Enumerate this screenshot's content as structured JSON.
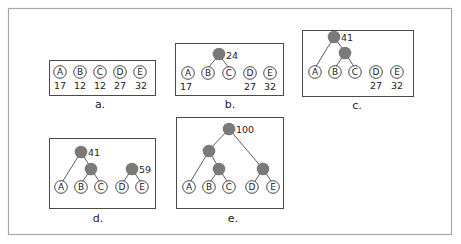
{
  "colors": {
    "leaf_fill": "#ffffff",
    "internal_node_fill": "#7a7a7a",
    "frame_border": "#a8a8a8",
    "panel_border": "#4a4a4a"
  },
  "symbols": [
    "A",
    "B",
    "C",
    "D",
    "E"
  ],
  "frequencies": {
    "A": 17,
    "B": 12,
    "C": 12,
    "D": 27,
    "E": 32
  },
  "panels": [
    {
      "id": "a",
      "caption": "a.",
      "leaves": [
        {
          "label": "A",
          "weight": "17"
        },
        {
          "label": "B",
          "weight": "12"
        },
        {
          "label": "C",
          "weight": "12"
        },
        {
          "label": "D",
          "weight": "27"
        },
        {
          "label": "E",
          "weight": "32"
        }
      ],
      "internal_nodes": []
    },
    {
      "id": "b",
      "caption": "b.",
      "leaves": [
        {
          "label": "A",
          "weight": "17"
        },
        {
          "label": "B",
          "weight": ""
        },
        {
          "label": "C",
          "weight": ""
        },
        {
          "label": "D",
          "weight": "27"
        },
        {
          "label": "E",
          "weight": "32"
        }
      ],
      "internal_nodes": [
        {
          "children": [
            "B",
            "C"
          ],
          "weight": "24"
        }
      ]
    },
    {
      "id": "c",
      "caption": "c.",
      "leaves": [
        {
          "label": "A",
          "weight": ""
        },
        {
          "label": "B",
          "weight": ""
        },
        {
          "label": "C",
          "weight": ""
        },
        {
          "label": "D",
          "weight": "27"
        },
        {
          "label": "E",
          "weight": "32"
        }
      ],
      "internal_nodes": [
        {
          "children": [
            "B",
            "C"
          ],
          "weight": ""
        },
        {
          "children": [
            "A",
            "BC"
          ],
          "weight": "41"
        }
      ]
    },
    {
      "id": "d",
      "caption": "d.",
      "leaves": [
        {
          "label": "A",
          "weight": ""
        },
        {
          "label": "B",
          "weight": ""
        },
        {
          "label": "C",
          "weight": ""
        },
        {
          "label": "D",
          "weight": ""
        },
        {
          "label": "E",
          "weight": ""
        }
      ],
      "internal_nodes": [
        {
          "children": [
            "B",
            "C"
          ],
          "weight": ""
        },
        {
          "children": [
            "A",
            "BC"
          ],
          "weight": "41"
        },
        {
          "children": [
            "D",
            "E"
          ],
          "weight": "59"
        }
      ]
    },
    {
      "id": "e",
      "caption": "e.",
      "leaves": [
        {
          "label": "A",
          "weight": ""
        },
        {
          "label": "B",
          "weight": ""
        },
        {
          "label": "C",
          "weight": ""
        },
        {
          "label": "D",
          "weight": ""
        },
        {
          "label": "E",
          "weight": ""
        }
      ],
      "internal_nodes": [
        {
          "children": [
            "B",
            "C"
          ],
          "weight": ""
        },
        {
          "children": [
            "A",
            "BC"
          ],
          "weight": ""
        },
        {
          "children": [
            "D",
            "E"
          ],
          "weight": ""
        },
        {
          "children": [
            "ABC",
            "DE"
          ],
          "weight": "100"
        }
      ]
    }
  ]
}
